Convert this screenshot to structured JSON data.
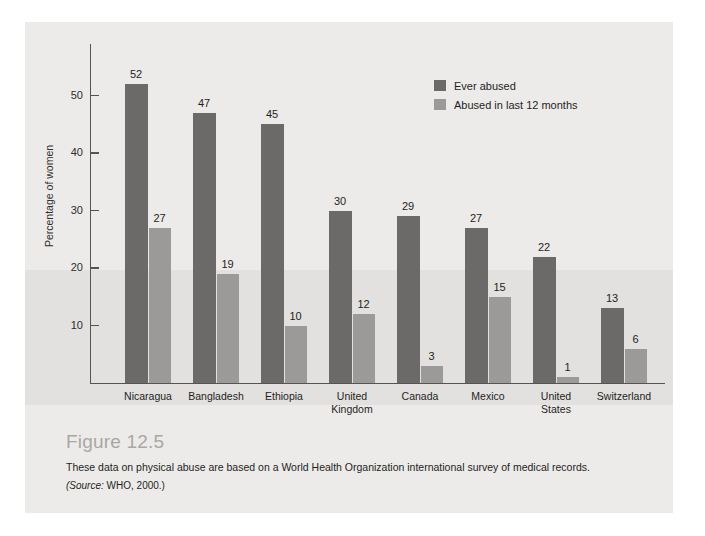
{
  "figure": {
    "number_label": "Figure 12.5",
    "description": "These data on physical abuse are based on a World Health Organization international survey of medical records.",
    "source_lead": "(Source:",
    "source_rest": " WHO, 2000.)"
  },
  "legend": {
    "position": "inside-top-right",
    "items": [
      {
        "label": "Ever abused",
        "color": "#6b6a68"
      },
      {
        "label": "Abused in last 12 months",
        "color": "#9b9a98"
      }
    ]
  },
  "axis": {
    "y_title": "Percentage of women",
    "y_ticks": [
      "10",
      "20",
      "30",
      "40",
      "50"
    ]
  },
  "chart_data": {
    "type": "bar",
    "title": "Figure 12.5",
    "subtitle": "These data on physical abuse are based on a World Health Organization international survey of medical records.",
    "annotations": [
      "(Source: WHO, 2000.)"
    ],
    "xlabel": "",
    "ylabel": "Percentage of women",
    "ylim": [
      0,
      55
    ],
    "yticks": [
      10,
      20,
      30,
      40,
      50
    ],
    "grid": false,
    "legend_position": "upper right",
    "categories": [
      "Nicaragua",
      "Bangladesh",
      "Ethiopia",
      "United Kingdom",
      "Canada",
      "Mexico",
      "United States",
      "Switzerland"
    ],
    "category_display": [
      "Nicaragua",
      "Bangladesh",
      "Ethiopia",
      "United\nKingdom",
      "Canada",
      "Mexico",
      "United\nStates",
      "Switzerland"
    ],
    "series": [
      {
        "name": "Ever abused",
        "color": "#6b6a68",
        "values": [
          52,
          47,
          45,
          30,
          29,
          27,
          22,
          13
        ]
      },
      {
        "name": "Abused in last 12 months",
        "color": "#9b9a98",
        "values": [
          27,
          19,
          10,
          12,
          3,
          15,
          1,
          6
        ]
      }
    ]
  }
}
